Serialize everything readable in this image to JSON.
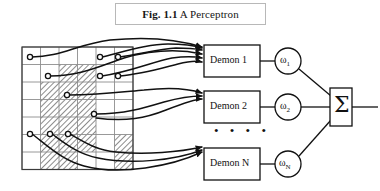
{
  "figure": {
    "caption_prefix": "Fig. 1.1",
    "caption_title": "A Perceptron",
    "caption_full": "Fig. 1.1 A Perceptron"
  },
  "colors": {
    "ink": "#111111",
    "page_background": "#ffffff",
    "grid_line": "#8d8d8d",
    "grid_border": "#3a3a3a",
    "hatch": "#6e6e6e",
    "caption_border": "#b8b8b8"
  },
  "retina": {
    "name": "retina-grid",
    "columns": 6,
    "rows": 7,
    "cell_width": 18.5,
    "cell_height": 17.5,
    "origin_x": 22,
    "origin_y": 47,
    "shaded_cells": [
      [
        2,
        1
      ],
      [
        3,
        1
      ],
      [
        1,
        2
      ],
      [
        2,
        2
      ],
      [
        3,
        2
      ],
      [
        1,
        3
      ],
      [
        2,
        3
      ],
      [
        3,
        3
      ],
      [
        1,
        4
      ],
      [
        2,
        4
      ],
      [
        3,
        4
      ],
      [
        1,
        5
      ],
      [
        2,
        5
      ],
      [
        3,
        5
      ],
      [
        5,
        5
      ],
      [
        1,
        6
      ],
      [
        2,
        6
      ],
      [
        5,
        6
      ]
    ],
    "sensors": [
      {
        "id": "s1",
        "x": 30,
        "y": 57
      },
      {
        "id": "s2",
        "x": 100,
        "y": 57
      },
      {
        "id": "s3",
        "x": 118,
        "y": 57
      },
      {
        "id": "s4",
        "x": 48,
        "y": 76
      },
      {
        "id": "s5",
        "x": 100,
        "y": 76
      },
      {
        "id": "s6",
        "x": 118,
        "y": 76
      },
      {
        "id": "s7",
        "x": 67,
        "y": 95
      },
      {
        "id": "s8",
        "x": 94,
        "y": 114
      },
      {
        "id": "s9",
        "x": 30,
        "y": 134
      },
      {
        "id": "s10",
        "x": 50,
        "y": 134
      },
      {
        "id": "s11",
        "x": 68,
        "y": 134
      }
    ]
  },
  "demons": [
    {
      "name": "demon-1",
      "label": "Demon 1",
      "box": {
        "x": 204,
        "y": 45,
        "w": 56,
        "h": 32
      },
      "weight": {
        "name": "weight-1",
        "label": "ω",
        "subscript": "1",
        "cx": 288,
        "cy": 61,
        "r": 13
      }
    },
    {
      "name": "demon-2",
      "label": "Demon 2",
      "box": {
        "x": 204,
        "y": 91,
        "w": 56,
        "h": 32
      },
      "weight": {
        "name": "weight-2",
        "label": "ω",
        "subscript": "2",
        "cx": 288,
        "cy": 107,
        "r": 13
      }
    },
    {
      "name": "demon-n",
      "label": "Demon N",
      "box": {
        "x": 204,
        "y": 148,
        "w": 56,
        "h": 32
      },
      "weight": {
        "name": "weight-n",
        "label": "ω",
        "subscript": "N",
        "cx": 288,
        "cy": 164,
        "r": 13
      }
    }
  ],
  "ellipsis": {
    "name": "demon-ellipsis",
    "text": "• • • •",
    "x": 214,
    "y": 130
  },
  "summation": {
    "name": "summation-unit",
    "symbol": "Σ",
    "box": {
      "x": 330,
      "y": 88,
      "w": 22,
      "h": 38
    },
    "output_line": {
      "x1": 352,
      "y1": 107,
      "x2": 378,
      "y2": 107
    }
  },
  "wires": {
    "description": "curved sensor-to-demon connection wires",
    "count": 11
  }
}
